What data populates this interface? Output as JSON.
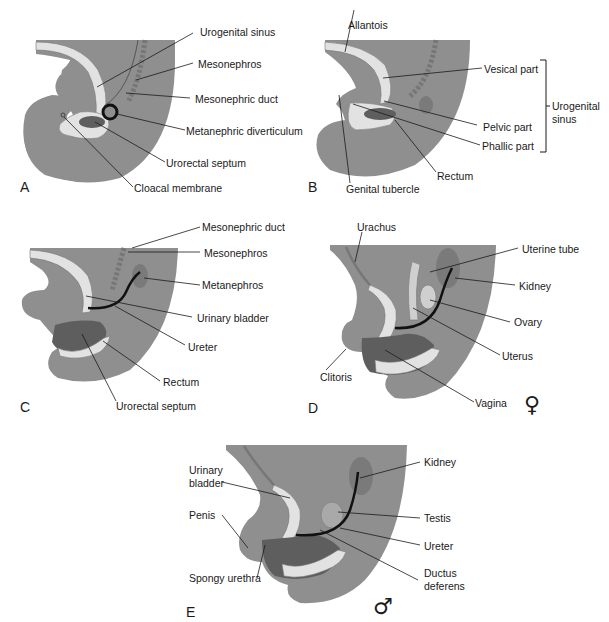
{
  "figure": {
    "colors": {
      "tissue": "#8f8f8f",
      "tissue_light": "#a9a9a9",
      "sinus": "#e2e2e2",
      "rectum_dark": "#5e5e5e",
      "kidney": "#7a7a7a",
      "ureter": "#111111",
      "leader": "#1a1a1a"
    },
    "panels": {
      "A": {
        "letter": "A",
        "labels": [
          "Urogenital sinus",
          "Mesonephros",
          "Mesonephric duct",
          "Metanephric diverticulum",
          "Urorectal septum",
          "Cloacal membrane"
        ]
      },
      "B": {
        "letter": "B",
        "labels": [
          "Allantois",
          "Vesical part",
          "Pelvic part",
          "Phallic part",
          "Rectum",
          "Genital tubercle"
        ],
        "bracket_label_line1": "Urogenital",
        "bracket_label_line2": "sinus"
      },
      "C": {
        "letter": "C",
        "labels": [
          "Mesonephric duct",
          "Mesonephros",
          "Metanephros",
          "Urinary bladder",
          "Ureter",
          "Rectum",
          "Urorectal septum"
        ]
      },
      "D": {
        "letter": "D",
        "sex_symbol": "♀",
        "labels": [
          "Urachus",
          "Uterine tube",
          "Kidney",
          "Ovary",
          "Uterus",
          "Clitoris",
          "Vagina"
        ]
      },
      "E": {
        "letter": "E",
        "sex_symbol": "♂",
        "labels": [
          "Kidney",
          "Urinary",
          "bladder",
          "Penis",
          "Testis",
          "Ureter",
          "Spongy urethra",
          "Ductus",
          "deferens"
        ]
      }
    }
  }
}
